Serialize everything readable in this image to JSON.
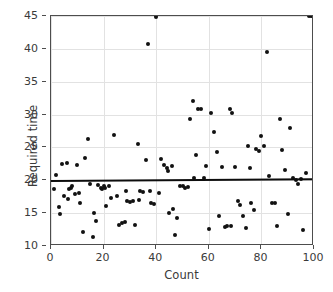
{
  "chart_data": {
    "type": "scatter",
    "title": "",
    "xlabel": "Count",
    "ylabel": "Required time",
    "xlim": [
      0,
      100
    ],
    "ylim": [
      10,
      45
    ],
    "xticks": [
      0,
      20,
      40,
      60,
      80,
      100
    ],
    "yticks": [
      10,
      15,
      20,
      25,
      30,
      35,
      40,
      45
    ],
    "grid": true,
    "legend": "none",
    "marker": {
      "shape": "circle",
      "color": "#111111",
      "size_px": 4
    },
    "trendline": {
      "type": "linear-fit",
      "color": "#0d0d0d",
      "x_start": 0,
      "y_start": 20.1,
      "x_end": 100,
      "y_end": 20.35
    },
    "x": [
      1,
      2,
      3,
      3.5,
      4,
      5,
      6,
      6.5,
      7,
      7.5,
      8,
      9,
      10,
      10.5,
      11,
      12,
      13,
      14,
      15,
      16,
      16.5,
      17,
      18,
      19,
      19.5,
      20,
      20.5,
      21,
      22,
      23,
      24,
      25,
      26,
      27,
      28,
      28.5,
      29,
      30,
      31,
      32,
      33,
      33.5,
      34,
      35,
      36,
      37,
      37.5,
      38,
      39,
      40,
      41,
      42,
      43,
      44,
      44.5,
      45,
      46,
      46.5,
      47,
      48,
      49,
      50,
      51,
      52,
      53,
      54,
      54.5,
      55,
      56,
      57,
      58,
      59,
      60,
      61,
      62,
      63,
      64,
      65,
      66,
      67,
      68,
      68.5,
      69,
      70,
      71,
      72,
      73,
      74,
      75,
      75.5,
      76,
      77,
      78,
      79,
      80,
      81,
      82,
      83,
      84,
      85,
      86,
      87,
      88,
      89,
      90,
      91,
      92,
      93,
      94,
      95,
      96,
      97,
      98,
      99,
      100
    ],
    "y": [
      18.7,
      20.8,
      15.9,
      14.9,
      22.5,
      17.6,
      22.6,
      17.1,
      18.6,
      18.8,
      19.1,
      17.9,
      22.3,
      18.0,
      16.5,
      12.2,
      23.4,
      26.3,
      19.5,
      11.3,
      15.0,
      13.8,
      19.3,
      18.8,
      18.6,
      19.1,
      18.9,
      16.1,
      19.2,
      17.3,
      26.9,
      17.6,
      13.2,
      13.5,
      13.6,
      18.4,
      16.8,
      16.7,
      16.8,
      13.2,
      25.5,
      17.0,
      18.3,
      18.2,
      23.1,
      40.8,
      18.4,
      16.5,
      16.4,
      44.9,
      18.1,
      23.2,
      22.3,
      21.8,
      21.4,
      15.0,
      22.2,
      15.6,
      11.6,
      14.2,
      19.1,
      19.2,
      18.9,
      19.0,
      29.4,
      32.0,
      20.3,
      23.9,
      30.8,
      30.9,
      20.4,
      22.2,
      12.6,
      30.3,
      27.4,
      24.3,
      14.5,
      22.0,
      12.9,
      13.0,
      30.9,
      13.1,
      30.2,
      22.0,
      16.8,
      16.3,
      14.6,
      12.8,
      25.2,
      21.9,
      16.6,
      15.5,
      24.7,
      24.4,
      26.7,
      25.2,
      39.5,
      20.6,
      16.5,
      16.5,
      13.0,
      29.3,
      24.6,
      21.6,
      14.8,
      28.0,
      20.4,
      20.0,
      19.5,
      20.2,
      12.5,
      21.1
    ]
  }
}
